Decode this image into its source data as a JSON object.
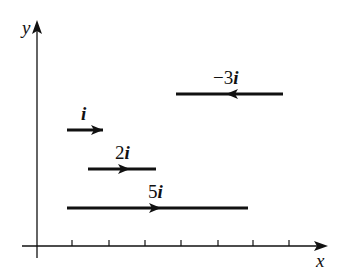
{
  "diagram": {
    "axes": {
      "x_label": "x",
      "y_label": "y",
      "tick_count": 7
    },
    "vectors": [
      {
        "id": "i",
        "coef": "",
        "unit": "i",
        "direction": "right",
        "length_units": 1
      },
      {
        "id": "2i",
        "coef": "2",
        "unit": "i",
        "direction": "right",
        "length_units": 2
      },
      {
        "id": "5i",
        "coef": "5",
        "unit": "i",
        "direction": "right",
        "length_units": 5
      },
      {
        "id": "neg3i",
        "coef": "−3",
        "unit": "i",
        "direction": "left",
        "length_units": 3
      }
    ],
    "colors": {
      "stroke": "#111111",
      "background": "#ffffff"
    }
  }
}
